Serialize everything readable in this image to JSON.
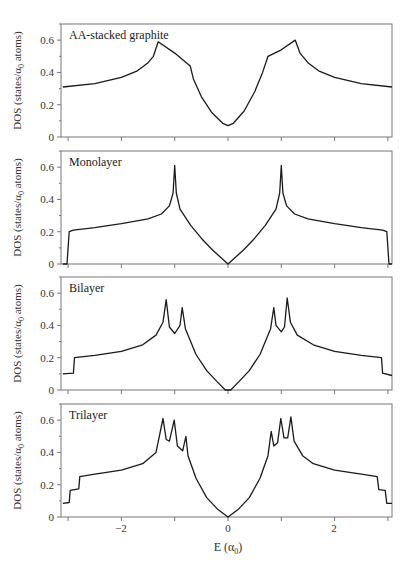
{
  "chart_data": [
    {
      "type": "line",
      "title": "AA-stacked graphite",
      "xlabel": "E (α0)",
      "ylabel": "DOS (states/α0 atoms)",
      "xlim": [
        -3.1,
        3.1
      ],
      "ylim": [
        0,
        0.7
      ],
      "yticks": [
        0,
        0.2,
        0.4,
        0.6
      ],
      "x": [
        -3.1,
        -2.5,
        -2.0,
        -1.7,
        -1.5,
        -1.4,
        -1.31,
        -1.0,
        -0.71,
        -0.65,
        -0.5,
        -0.3,
        -0.1,
        0.0,
        0.1,
        0.3,
        0.5,
        0.65,
        0.75,
        1.0,
        1.26,
        1.35,
        1.5,
        1.7,
        2.0,
        2.5,
        3.1
      ],
      "y": [
        0.31,
        0.33,
        0.37,
        0.41,
        0.46,
        0.5,
        0.59,
        0.52,
        0.44,
        0.36,
        0.25,
        0.15,
        0.085,
        0.07,
        0.085,
        0.16,
        0.28,
        0.4,
        0.5,
        0.54,
        0.6,
        0.52,
        0.46,
        0.41,
        0.37,
        0.33,
        0.31
      ]
    },
    {
      "type": "line",
      "title": "Monolayer",
      "xlabel": "E (α0)",
      "ylabel": "DOS (states/α0 atoms)",
      "xlim": [
        -3.1,
        3.1
      ],
      "ylim": [
        0,
        0.7
      ],
      "yticks": [
        0,
        0.2,
        0.4,
        0.6
      ],
      "x": [
        -3.1,
        -3.02,
        -2.98,
        -2.9,
        -2.5,
        -2.0,
        -1.5,
        -1.25,
        -1.1,
        -1.03,
        -1.0,
        -0.97,
        -0.9,
        -0.7,
        -0.5,
        -0.3,
        -0.1,
        0.0,
        0.1,
        0.3,
        0.5,
        0.7,
        0.9,
        0.97,
        1.0,
        1.03,
        1.1,
        1.25,
        1.5,
        2.0,
        2.5,
        2.9,
        2.98,
        3.02,
        3.1
      ],
      "y": [
        0.0,
        0.0,
        0.2,
        0.21,
        0.225,
        0.25,
        0.28,
        0.31,
        0.36,
        0.44,
        0.61,
        0.44,
        0.34,
        0.24,
        0.16,
        0.09,
        0.03,
        0.0,
        0.03,
        0.09,
        0.16,
        0.24,
        0.34,
        0.44,
        0.61,
        0.44,
        0.36,
        0.31,
        0.28,
        0.25,
        0.225,
        0.21,
        0.2,
        0.0,
        0.0
      ]
    },
    {
      "type": "line",
      "title": "Bilayer",
      "xlabel": "E (α0)",
      "ylabel": "DOS (states/α0 atoms)",
      "xlim": [
        -3.1,
        3.1
      ],
      "ylim": [
        0,
        0.7
      ],
      "yticks": [
        0,
        0.2,
        0.4,
        0.6
      ],
      "x": [
        -3.1,
        -2.9,
        -2.88,
        -2.5,
        -2.0,
        -1.6,
        -1.35,
        -1.22,
        -1.16,
        -1.1,
        -1.0,
        -0.9,
        -0.86,
        -0.8,
        -0.6,
        -0.4,
        -0.2,
        -0.05,
        0.05,
        0.2,
        0.4,
        0.6,
        0.8,
        0.86,
        0.9,
        1.0,
        1.06,
        1.11,
        1.17,
        1.3,
        1.6,
        2.0,
        2.5,
        2.88,
        2.9,
        3.1
      ],
      "y": [
        0.1,
        0.105,
        0.2,
        0.215,
        0.24,
        0.28,
        0.34,
        0.42,
        0.56,
        0.39,
        0.35,
        0.4,
        0.51,
        0.38,
        0.22,
        0.12,
        0.05,
        0.0,
        0.0,
        0.05,
        0.12,
        0.22,
        0.38,
        0.51,
        0.4,
        0.36,
        0.39,
        0.57,
        0.42,
        0.34,
        0.28,
        0.24,
        0.215,
        0.2,
        0.105,
        0.09
      ]
    },
    {
      "type": "line",
      "title": "Trilayer",
      "xlabel": "E (α0)",
      "ylabel": "DOS (states/α0 atoms)",
      "xlim": [
        -3.1,
        3.1
      ],
      "ylim": [
        0,
        0.7
      ],
      "yticks": [
        0,
        0.2,
        0.4,
        0.6
      ],
      "xticks": [
        -2,
        0,
        2
      ],
      "x": [
        -3.1,
        -2.98,
        -2.96,
        -2.8,
        -2.78,
        -2.5,
        -2.0,
        -1.6,
        -1.35,
        -1.22,
        -1.16,
        -1.1,
        -1.01,
        -0.95,
        -0.85,
        -0.79,
        -0.75,
        -0.6,
        -0.4,
        -0.2,
        0.0,
        0.2,
        0.4,
        0.6,
        0.75,
        0.81,
        0.86,
        0.93,
        0.99,
        1.05,
        1.12,
        1.18,
        1.24,
        1.4,
        1.6,
        2.0,
        2.5,
        2.8,
        2.83,
        2.95,
        2.98,
        3.1
      ],
      "y": [
        0.085,
        0.09,
        0.165,
        0.175,
        0.25,
        0.265,
        0.29,
        0.33,
        0.4,
        0.61,
        0.48,
        0.47,
        0.6,
        0.44,
        0.41,
        0.5,
        0.38,
        0.24,
        0.12,
        0.05,
        0.0,
        0.05,
        0.12,
        0.24,
        0.38,
        0.53,
        0.44,
        0.46,
        0.61,
        0.49,
        0.49,
        0.62,
        0.47,
        0.38,
        0.33,
        0.29,
        0.265,
        0.25,
        0.17,
        0.165,
        0.085,
        0.085
      ]
    }
  ],
  "panels": [
    {
      "label": "AA-stacked graphite"
    },
    {
      "label": "Monolayer"
    },
    {
      "label": "Bilayer"
    },
    {
      "label": "Trilayer"
    }
  ],
  "axes": {
    "ylabel": "DOS (states/α",
    "ylabel_sub": "0",
    "ylabel_end": " atoms)",
    "xlabel": "E (α",
    "xlabel_sub": "0",
    "xlabel_end": ")",
    "ytick_labels": [
      "0",
      "0.2",
      "0.4",
      "0.6"
    ],
    "xtick_labels": [
      "−2",
      "0",
      "2"
    ]
  },
  "colors": {
    "curve": "#1a1a1a",
    "axis": "#777777",
    "background": "#ffffff"
  }
}
